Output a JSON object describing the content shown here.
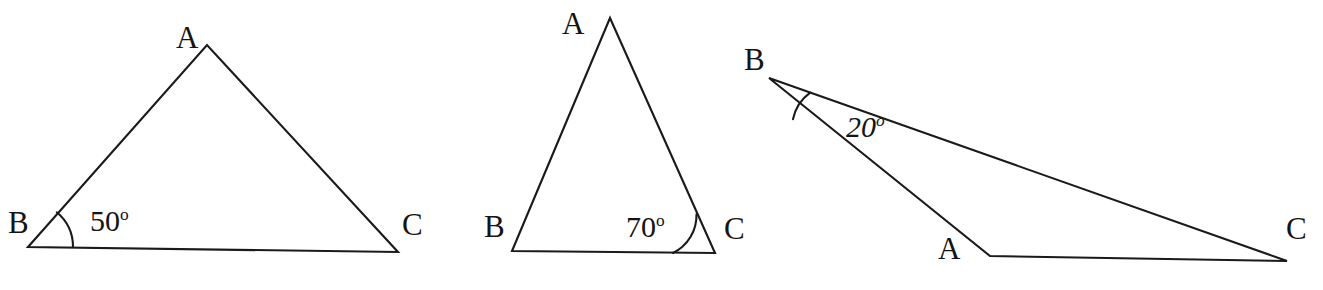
{
  "figure": {
    "background_color": "#ffffff",
    "stroke_color": "#1a1a1a",
    "text_color": "#141414",
    "width": 1323,
    "height": 290
  },
  "triangles": [
    {
      "id": "triangle-1",
      "vertices": {
        "A": {
          "label": "A",
          "x": 207,
          "y": 45
        },
        "B": {
          "label": "B",
          "x": 28,
          "y": 247
        },
        "C": {
          "label": "C",
          "x": 398,
          "y": 252
        }
      },
      "vertex_label_positions": {
        "A": {
          "x": 176,
          "y": 22
        },
        "B": {
          "x": 8,
          "y": 207
        },
        "C": {
          "x": 402,
          "y": 209
        }
      },
      "marked_angle": {
        "at_vertex": "B",
        "value": 50,
        "unit": "degrees",
        "text": "50",
        "degree_glyph": "o",
        "label_x": 90,
        "label_y": 206,
        "arc_radius": 45,
        "italic": false
      },
      "path": "M 28 247 L 207 45 L 398 252 Z"
    },
    {
      "id": "triangle-2",
      "vertices": {
        "A": {
          "label": "A",
          "x": 610,
          "y": 18
        },
        "B": {
          "label": "B",
          "x": 512,
          "y": 251
        },
        "C": {
          "label": "C",
          "x": 715,
          "y": 253
        }
      },
      "vertex_label_positions": {
        "A": {
          "x": 562,
          "y": 8
        },
        "B": {
          "x": 484,
          "y": 211
        },
        "C": {
          "x": 724,
          "y": 213
        }
      },
      "marked_angle": {
        "at_vertex": "C",
        "value": 70,
        "unit": "degrees",
        "text": "70",
        "degree_glyph": "o",
        "label_x": 626,
        "label_y": 212,
        "arc_radius": 42,
        "italic": false
      },
      "path": "M 512 251 L 610 18 L 715 253 Z"
    },
    {
      "id": "triangle-3",
      "vertices": {
        "A": {
          "label": "A",
          "x": 990,
          "y": 256
        },
        "B": {
          "label": "B",
          "x": 769,
          "y": 78
        },
        "C": {
          "label": "C",
          "x": 1287,
          "y": 261
        }
      },
      "vertex_label_positions": {
        "A": {
          "x": 938,
          "y": 233
        },
        "B": {
          "x": 744,
          "y": 44
        },
        "C": {
          "x": 1286,
          "y": 213
        }
      },
      "marked_angle": {
        "at_vertex": "B",
        "value": 20,
        "unit": "degrees",
        "text": "20",
        "degree_glyph": "o",
        "label_x": 846,
        "label_y": 112,
        "arc_radius": 44,
        "italic": true
      },
      "path": "M 769 78 L 1287 261 L 990 256 Z"
    }
  ]
}
